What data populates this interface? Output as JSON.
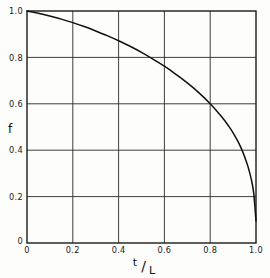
{
  "chart_data": {
    "type": "line",
    "title": "",
    "xlabel": "t/L",
    "ylabel": "f",
    "xlim": [
      0,
      1.0
    ],
    "ylim": [
      0,
      1.0
    ],
    "grid": true,
    "legend": "none",
    "x_ticks": [
      "0",
      "0.2",
      "0.4",
      "0.6",
      "0.8",
      "1.0"
    ],
    "x_tick_values": [
      0,
      0.2,
      0.4,
      0.6,
      0.8,
      1.0
    ],
    "y_ticks": [
      "0",
      "0.2",
      "0.4",
      "0.6",
      "0.8",
      "1.0"
    ],
    "y_tick_values": [
      0,
      0.2,
      0.4,
      0.6,
      0.8,
      1.0
    ],
    "series": [
      {
        "name": "f",
        "x": [
          0.0,
          0.05,
          0.1,
          0.15,
          0.2,
          0.25,
          0.3,
          0.35,
          0.4,
          0.45,
          0.5,
          0.55,
          0.6,
          0.65,
          0.7,
          0.75,
          0.8,
          0.85,
          0.88,
          0.9,
          0.92,
          0.94,
          0.96,
          0.97,
          0.98,
          0.99,
          1.0
        ],
        "y": [
          1.0,
          0.99,
          0.978,
          0.965,
          0.95,
          0.933,
          0.914,
          0.894,
          0.872,
          0.848,
          0.822,
          0.793,
          0.762,
          0.727,
          0.69,
          0.648,
          0.6,
          0.544,
          0.505,
          0.475,
          0.44,
          0.398,
          0.345,
          0.312,
          0.272,
          0.215,
          0.095
        ]
      }
    ],
    "annotations": []
  },
  "axes": {
    "x_axis_label": "t/L",
    "x_axis_label_numerator": "t",
    "x_axis_label_bar": "/",
    "x_axis_label_denominator": "L",
    "y_axis_label": "f"
  },
  "style": {
    "background": "#fdfdfc",
    "frame_color": "#1a1a1a",
    "grid_color": "#2a2a2a",
    "curve_color": "#111111",
    "tick_label_color": "#1a1a1a"
  }
}
